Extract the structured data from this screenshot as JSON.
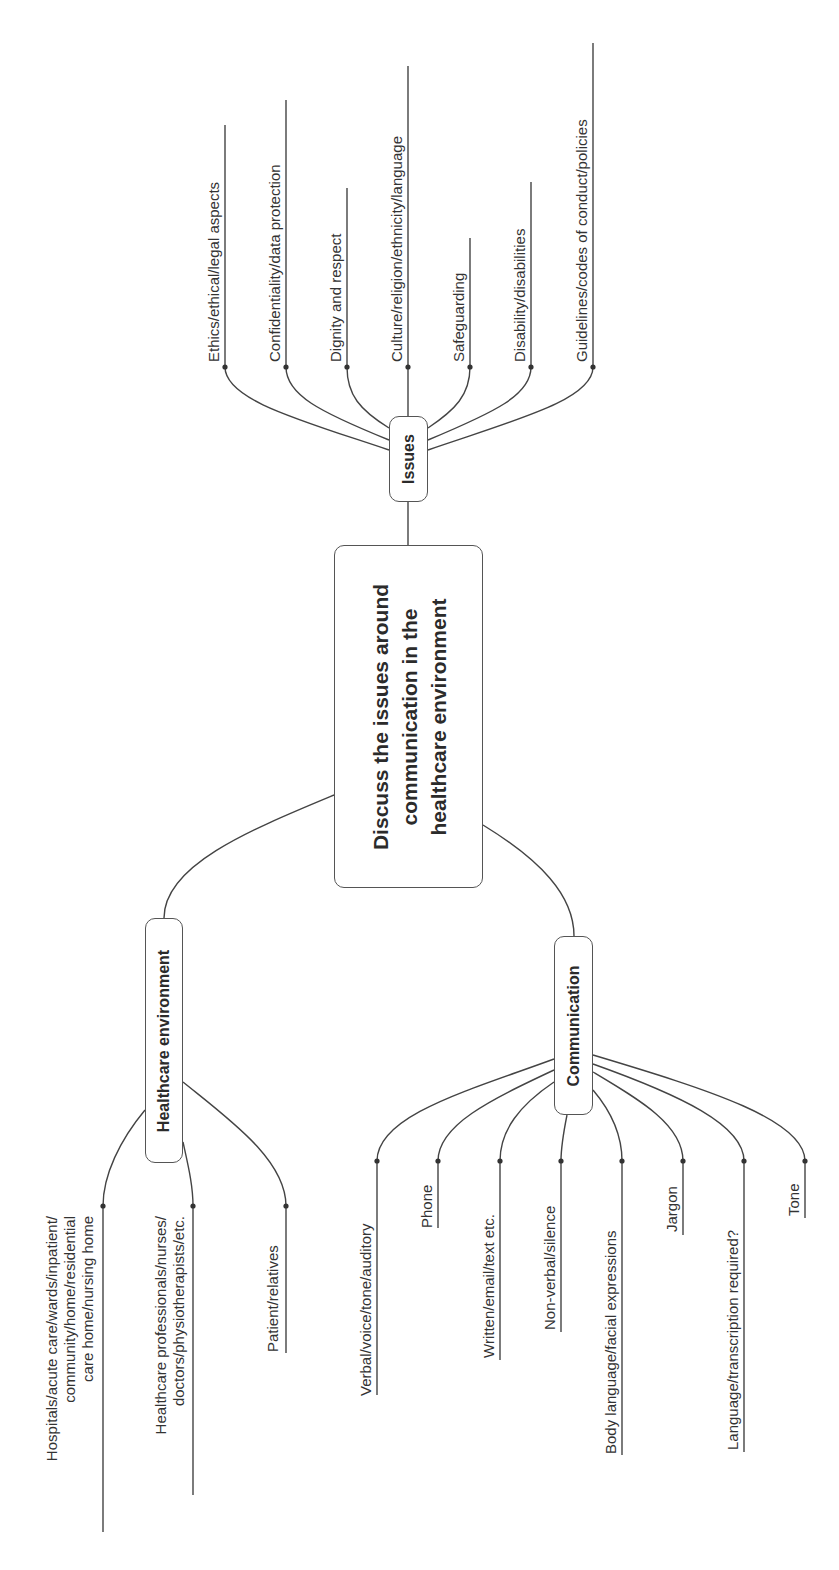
{
  "center": {
    "lines": [
      "Discuss the issues around",
      "communication in the",
      "healthcare environment"
    ]
  },
  "branches": {
    "issues": {
      "label": "Issues",
      "leaves": [
        "Ethics/ethical/legal aspects",
        "Confidentiality/data protection",
        "Dignity and respect",
        "Culture/religion/ethnicity/language",
        "Safeguarding",
        "Disability/disabilities",
        "Guidelines/codes of conduct/policies"
      ]
    },
    "healthcare_environment": {
      "label": "Healthcare environment",
      "leaves": [
        {
          "lines": [
            "Hospitals/acute care/wards/inpatient/",
            "community/home/residential",
            "care home/nursing home"
          ]
        },
        {
          "lines": [
            "Healthcare professionals/nurses/",
            "doctors/physiotherapists/etc."
          ]
        },
        {
          "lines": [
            "Patient/relatives"
          ]
        }
      ]
    },
    "communication": {
      "label": "Communication",
      "leaves": [
        "Verbal/voice/tone/auditory",
        "Phone",
        "Written/email/text etc.",
        "Non-verbal/silence",
        "Body language/facial expressions",
        "Jargon",
        "Language/transcription required?",
        "Tone"
      ]
    }
  },
  "colors": {
    "line": "#444444",
    "text": "#2b2b2b",
    "background": "#ffffff"
  }
}
